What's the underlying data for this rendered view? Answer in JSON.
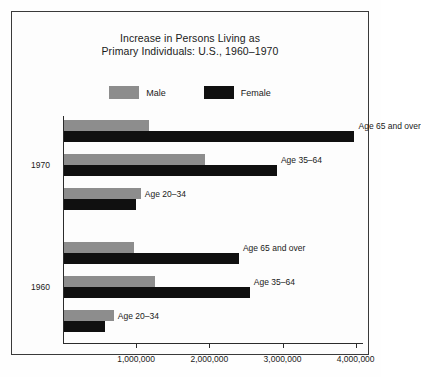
{
  "title": {
    "line1": "Increase in Persons Living as",
    "line2": "Primary Individuals: U.S., 1960–1970"
  },
  "legend": {
    "position": "top-center",
    "entries": [
      {
        "label": "Male",
        "color": "#8d8d8d"
      },
      {
        "label": "Female",
        "color": "#101010"
      }
    ]
  },
  "axis": {
    "ticks": [
      {
        "value": 0,
        "label": ""
      },
      {
        "value": 1000000,
        "label": "1,000,000"
      },
      {
        "value": 2000000,
        "label": "2,000,000"
      },
      {
        "value": 3000000,
        "label": "3,000,000"
      },
      {
        "value": 4000000,
        "label": "4,000,000"
      }
    ],
    "xlim": [
      0,
      4100000
    ]
  },
  "groups": [
    {
      "year": "1970",
      "rows": [
        {
          "age": "Age 65 and over",
          "male": 1160000,
          "female": 3970000
        },
        {
          "age": "Age 35–64",
          "male": 1930000,
          "female": 2910000
        },
        {
          "age": "Age 20–34",
          "male": 1050000,
          "female": 980000
        }
      ]
    },
    {
      "year": "1960",
      "rows": [
        {
          "age": "Age 65 and over",
          "male": 950000,
          "female": 2390000
        },
        {
          "age": "Age 35–64",
          "male": 1250000,
          "female": 2540000
        },
        {
          "age": "Age 20–34",
          "male": 680000,
          "female": 560000
        }
      ]
    }
  ],
  "chart_data": {
    "type": "bar",
    "orientation": "horizontal",
    "title": "Increase in Persons Living as Primary Individuals: U.S., 1960–1970",
    "xlabel": "",
    "ylabel": "",
    "xlim": [
      0,
      4100000
    ],
    "grid": false,
    "legend_position": "top-center",
    "xticks": [
      0,
      1000000,
      2000000,
      3000000,
      4000000
    ],
    "xticklabels": [
      "",
      "1,000,000",
      "2,000,000",
      "3,000,000",
      "4,000,000"
    ],
    "categories": [
      "1970 Age 65 and over",
      "1970 Age 35–64",
      "1970 Age 20–34",
      "1960 Age 65 and over",
      "1960 Age 35–64",
      "1960 Age 20–34"
    ],
    "series": [
      {
        "name": "Male",
        "color": "#8d8d8d",
        "values": [
          1160000,
          1930000,
          1050000,
          950000,
          1250000,
          680000
        ]
      },
      {
        "name": "Female",
        "color": "#101010",
        "values": [
          3970000,
          2910000,
          980000,
          2390000,
          2540000,
          560000
        ]
      }
    ],
    "group_labels": [
      "1970",
      "1960"
    ],
    "annotations": [
      "Age 65 and over",
      "Age 35–64",
      "Age 20–34",
      "Age 65 and over",
      "Age 35–64",
      "Age 20–34"
    ]
  }
}
